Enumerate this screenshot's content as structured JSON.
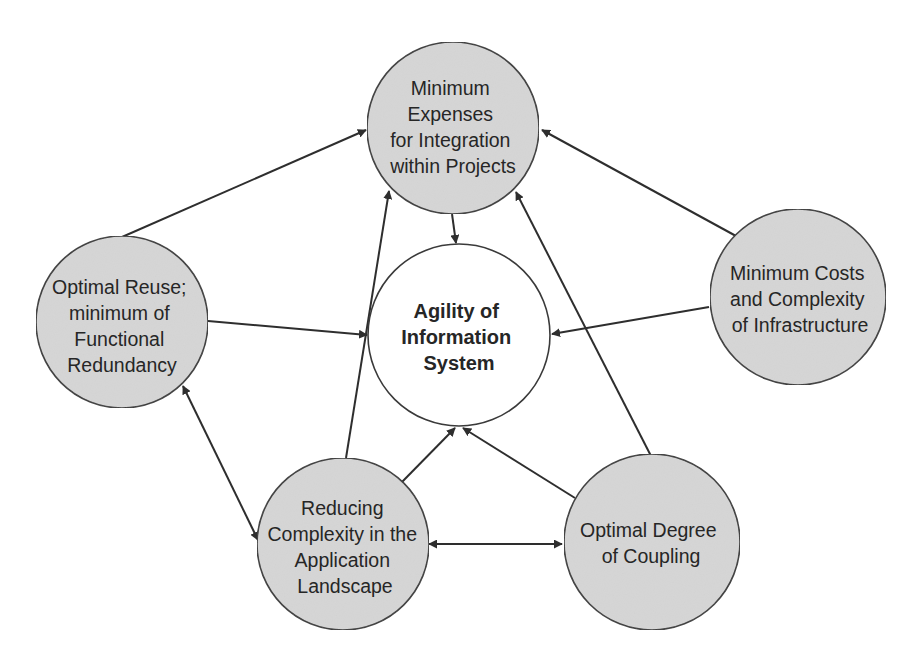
{
  "diagram": {
    "colors": {
      "node_fill": "#d6d6d6",
      "center_fill": "#ffffff",
      "stroke": "#3a3a3a",
      "text": "#262626"
    },
    "center": {
      "id": "agility",
      "lines": [
        "Agility of",
        "Information",
        "System"
      ]
    },
    "nodes": [
      {
        "id": "min-expenses",
        "lines": [
          "Minimum",
          "Expenses",
          "for Integration",
          "within Projects"
        ]
      },
      {
        "id": "optimal-reuse",
        "lines": [
          "Optimal Reuse;",
          "minimum of",
          "Functional",
          "Redundancy"
        ]
      },
      {
        "id": "min-costs",
        "lines": [
          "Minimum Costs",
          "and Complexity",
          "of Infrastructure"
        ]
      },
      {
        "id": "reducing-complexity",
        "lines": [
          "Reducing",
          "Complexity in the",
          "Application",
          "Landscape"
        ]
      },
      {
        "id": "optimal-coupling",
        "lines": [
          "Optimal Degree",
          "of Coupling"
        ]
      }
    ],
    "edges": [
      {
        "from": "min-expenses",
        "to": "agility",
        "type": "directed"
      },
      {
        "from": "optimal-reuse",
        "to": "min-expenses",
        "type": "directed"
      },
      {
        "from": "optimal-reuse",
        "to": "agility",
        "type": "directed"
      },
      {
        "from": "min-costs",
        "to": "min-expenses",
        "type": "directed"
      },
      {
        "from": "min-costs",
        "to": "agility",
        "type": "directed"
      },
      {
        "from": "reducing-complexity",
        "to": "min-expenses",
        "type": "directed"
      },
      {
        "from": "reducing-complexity",
        "to": "agility",
        "type": "directed"
      },
      {
        "from": "optimal-coupling",
        "to": "min-expenses",
        "type": "directed"
      },
      {
        "from": "optimal-coupling",
        "to": "agility",
        "type": "directed"
      },
      {
        "from": "optimal-reuse",
        "to": "reducing-complexity",
        "type": "bidirectional"
      },
      {
        "from": "reducing-complexity",
        "to": "optimal-coupling",
        "type": "bidirectional"
      }
    ]
  }
}
